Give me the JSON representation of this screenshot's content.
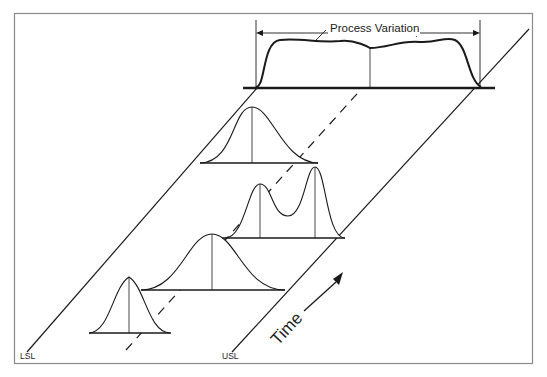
{
  "diagram": {
    "title": "Process Variation",
    "labels": {
      "lsl": "LSL",
      "usl": "USL",
      "time": "Time",
      "process_variation": "Process Variation"
    },
    "colors": {
      "stroke": "#1a1a1a",
      "frame": "#8a8a8a",
      "background": "#ffffff"
    },
    "distributions": [
      {
        "name": "narrow-normal",
        "order": 1
      },
      {
        "name": "wide-normal",
        "order": 2
      },
      {
        "name": "bimodal",
        "order": 3
      },
      {
        "name": "normal",
        "order": 4
      },
      {
        "name": "combined-flat",
        "order": 5
      }
    ]
  }
}
